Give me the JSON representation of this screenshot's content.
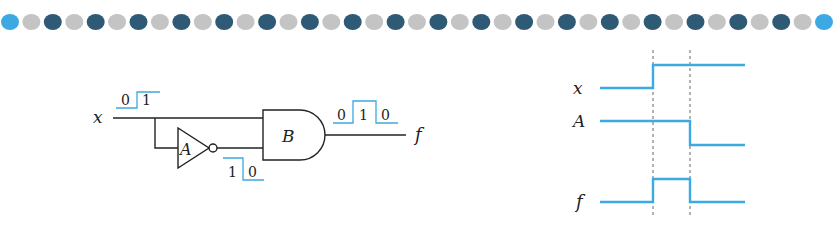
{
  "header": {
    "dot_colors": {
      "accent": "#3ca9e2",
      "gray": "#c4c4c4",
      "dark": "#2f5a75"
    },
    "dot_count": 39
  },
  "circuit": {
    "input_label": "x",
    "not_gate_label": "A",
    "and_gate_label": "B",
    "output_label": "f",
    "input_wave_labels": [
      "0",
      "1"
    ],
    "not_wave_labels": [
      "1",
      "0"
    ],
    "output_wave_labels": [
      "0",
      "1",
      "0"
    ],
    "wire_color": "#222222",
    "wave_color": "#3ca9e2"
  },
  "timing": {
    "signals": [
      {
        "name": "x",
        "levels": [
          "low",
          "high",
          "high"
        ]
      },
      {
        "name": "A",
        "levels": [
          "high",
          "high",
          "low"
        ]
      },
      {
        "name": "f",
        "levels": [
          "low",
          "high",
          "low"
        ]
      }
    ],
    "trace_color": "#3ca9e2",
    "marker_color": "#555555"
  }
}
